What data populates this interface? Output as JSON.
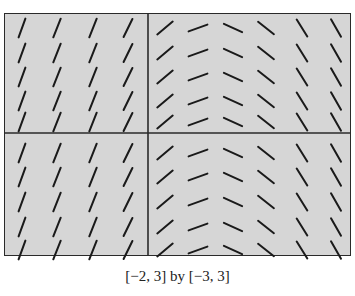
{
  "figure": {
    "type": "slope-field",
    "caption": "[−2, 3] by [−3, 3]",
    "window": {
      "xmin": -2,
      "xmax": 3,
      "ymin": -3,
      "ymax": 3
    },
    "colors": {
      "background": "#d6d6d6",
      "segment": "#1a1a1a",
      "axis": "#2a2a2a"
    },
    "axes": {
      "vertical_axis_x_px": 148,
      "horizontal_axis_y_px": 133
    },
    "grid": {
      "column_centers_px": [
        22,
        57,
        93,
        128,
        165,
        198,
        233,
        266,
        302,
        336
      ],
      "row_centers_px": [
        28,
        53,
        77,
        101,
        122,
        153,
        177,
        202,
        227,
        250
      ],
      "column_angles_deg": [
        70,
        68,
        68,
        64,
        40,
        20,
        -25,
        -38,
        -58,
        -60
      ],
      "segment_length_px": 20
    }
  }
}
